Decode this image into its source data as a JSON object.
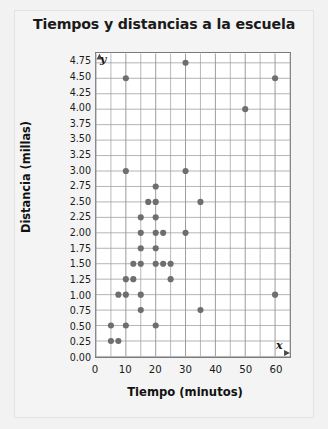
{
  "chart_data": {
    "type": "scatter",
    "title": "Tiempos y distancias a la escuela",
    "xlabel": "Tiempo (minutos)",
    "ylabel": "Distancia (millas)",
    "axis_letters": {
      "x": "x",
      "y": "y"
    },
    "xlim": [
      0,
      65
    ],
    "ylim": [
      0,
      4.9
    ],
    "grid": true,
    "legend": "none",
    "x_ticks": [
      0,
      10,
      20,
      30,
      40,
      50,
      60
    ],
    "x_tick_labels": [
      "0",
      "10",
      "20",
      "30",
      "40",
      "50",
      "60"
    ],
    "x_minor_step": 5,
    "y_ticks": [
      0.0,
      0.25,
      0.5,
      0.75,
      1.0,
      1.25,
      1.5,
      1.75,
      2.0,
      2.25,
      2.5,
      2.75,
      3.0,
      3.25,
      3.5,
      3.75,
      4.0,
      4.25,
      4.5,
      4.75
    ],
    "y_tick_labels": [
      "0.00",
      "0.25",
      "0.50",
      "0.75",
      "1.00",
      "1.25",
      "1.50",
      "1.75",
      "2.00",
      "2.25",
      "2.50",
      "2.75",
      "3.00",
      "3.25",
      "3.50",
      "3.75",
      "4.00",
      "4.25",
      "4.50",
      "4.75"
    ],
    "marker": {
      "shape": "circle",
      "color": "#6e6e6e",
      "radius": 3.1
    },
    "grid_color": "#9a9aa0",
    "frame_color": "#7a7a7a",
    "points": [
      [
        30,
        4.75
      ],
      [
        10,
        4.5
      ],
      [
        60,
        4.5
      ],
      [
        50,
        4.0
      ],
      [
        10,
        3.0
      ],
      [
        30,
        3.0
      ],
      [
        20,
        2.75
      ],
      [
        17.5,
        2.5
      ],
      [
        20,
        2.5
      ],
      [
        35,
        2.5
      ],
      [
        15,
        2.25
      ],
      [
        20,
        2.25
      ],
      [
        15,
        2.0
      ],
      [
        20,
        2.0
      ],
      [
        22.5,
        2.0
      ],
      [
        30,
        2.0
      ],
      [
        15,
        1.75
      ],
      [
        20,
        1.75
      ],
      [
        12.5,
        1.5
      ],
      [
        15,
        1.5
      ],
      [
        20,
        1.5
      ],
      [
        22.5,
        1.5
      ],
      [
        25,
        1.5
      ],
      [
        10,
        1.25
      ],
      [
        12.5,
        1.25
      ],
      [
        25,
        1.25
      ],
      [
        7.5,
        1.0
      ],
      [
        10,
        1.0
      ],
      [
        15,
        1.0
      ],
      [
        60,
        1.0
      ],
      [
        15,
        0.75
      ],
      [
        35,
        0.75
      ],
      [
        5,
        0.5
      ],
      [
        10,
        0.5
      ],
      [
        20,
        0.5
      ],
      [
        5,
        0.25
      ],
      [
        7.5,
        0.25
      ]
    ]
  }
}
